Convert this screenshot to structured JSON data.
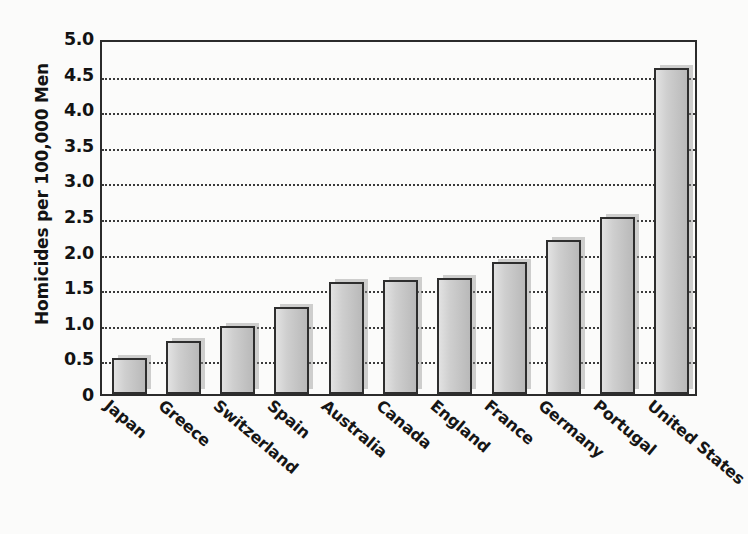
{
  "chart_data": {
    "type": "bar",
    "title": "",
    "subtitle": "",
    "xlabel": "",
    "ylabel": "Homicides per 100,000 Men",
    "categories": [
      "Japan",
      "Greece",
      "Switzerland",
      "Spain",
      "Australia",
      "Canada",
      "England",
      "France",
      "Germany",
      "Portugal",
      "United States"
    ],
    "values": [
      0.5,
      0.75,
      0.95,
      1.22,
      1.57,
      1.6,
      1.63,
      1.85,
      2.17,
      2.48,
      4.58
    ],
    "ylim": [
      0,
      5.0
    ],
    "ytick_values": [
      0,
      0.5,
      1.0,
      1.5,
      2.0,
      2.5,
      3.0,
      3.5,
      4.0,
      4.5,
      5.0
    ],
    "ytick_labels": [
      "0",
      "0.5",
      "1.0",
      "1.5",
      "2.0",
      "2.5",
      "3.0",
      "3.5",
      "4.0",
      "4.5",
      "5.0"
    ],
    "gridlines": {
      "axis": "y",
      "values": [
        0.5,
        1.0,
        1.5,
        2.0,
        2.5,
        3.0,
        3.5,
        4.0,
        4.5
      ],
      "style": "dotted"
    },
    "legend": {
      "visible": false,
      "position": "none",
      "entries": []
    },
    "bar_color": "#cccccc",
    "bar_edge_color": "#2e2e2e",
    "background_color": "#fbfbfa",
    "text_color": "#131313",
    "xlabel_rotation": 40
  }
}
